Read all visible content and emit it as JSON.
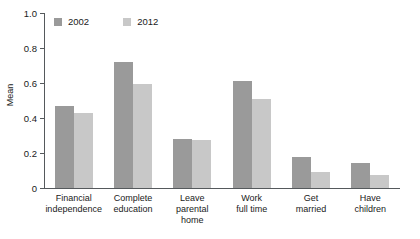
{
  "chart_data": {
    "type": "bar",
    "title": "",
    "xlabel": "",
    "ylabel": "Mean",
    "ylim": [
      0,
      1.0
    ],
    "yticks": [
      "0",
      "0.2",
      "0.4",
      "0.6",
      "0.8",
      "1.0"
    ],
    "ytick_values": [
      0,
      0.2,
      0.4,
      0.6,
      0.8,
      1.0
    ],
    "grid": false,
    "legend_position": "top-left",
    "categories": [
      "Financial independence",
      "Complete education",
      "Leave parental home",
      "Work full time",
      "Get married",
      "Have children"
    ],
    "category_lines": [
      [
        "Financial",
        "independence"
      ],
      [
        "Complete",
        "education"
      ],
      [
        "Leave",
        "parental",
        "home"
      ],
      [
        "Work",
        "full time"
      ],
      [
        "Get",
        "married"
      ],
      [
        "Have",
        "children"
      ]
    ],
    "series": [
      {
        "name": "2002",
        "color": "#9a9a9a",
        "values": [
          0.47,
          0.72,
          0.28,
          0.61,
          0.18,
          0.145
        ]
      },
      {
        "name": "2012",
        "color": "#c8c8c8",
        "values": [
          0.43,
          0.595,
          0.275,
          0.51,
          0.09,
          0.075
        ]
      }
    ]
  },
  "axis": {
    "line_color": "#55595c",
    "text_color": "#1a1a1a"
  }
}
